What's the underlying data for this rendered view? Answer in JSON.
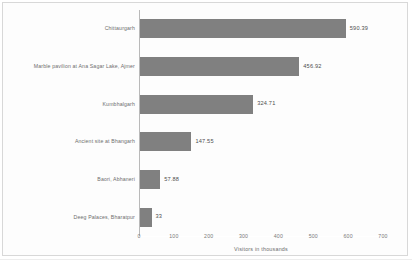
{
  "chart_data": {
    "type": "bar",
    "orientation": "horizontal",
    "title": "",
    "subtitle": "",
    "xlabel": "Visitors in thousands",
    "ylabel": "",
    "xlim": [
      0,
      700
    ],
    "grid": false,
    "legend": null,
    "categories": [
      "Chittaurgarh",
      "Marble pavilion at Ana Sagar Lake, Ajmer",
      "Kumbhalgarh",
      "Ancient site at Bhangarh",
      "Baori, Abhaneri",
      "Deeg Palaces, Bharatpur"
    ],
    "values": [
      590.39,
      456.92,
      324.71,
      147.55,
      57.88,
      33
    ],
    "value_labels": [
      "590.39",
      "456.92",
      "324.71",
      "147.55",
      "57.88",
      "33"
    ],
    "xticks": [
      0,
      100,
      200,
      300,
      400,
      500,
      600,
      700
    ],
    "xtick_labels": [
      "0",
      "100",
      "200",
      "300",
      "400",
      "500",
      "600",
      "700"
    ],
    "bar_color": "#808080",
    "axis_color": "#b9b9b9",
    "label_color": "#6d6d6d",
    "background": "#ffffff"
  }
}
